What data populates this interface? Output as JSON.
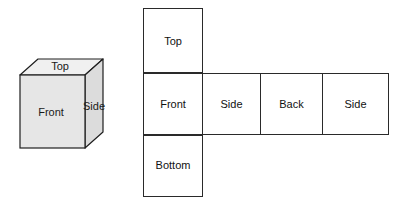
{
  "figure": {
    "title_visible": false,
    "background_color": "#ffffff"
  },
  "cube": {
    "name": "three-dimensional-cube",
    "projection": "oblique",
    "faces": [
      {
        "id": "front",
        "label": "Front",
        "fill": "#e6e6e6"
      },
      {
        "id": "top",
        "label": "Top",
        "fill": "#f0f0f0"
      },
      {
        "id": "side",
        "label": "Side",
        "fill": "#dcdcdc"
      }
    ],
    "outline_color": "#1f1f1f"
  },
  "net": {
    "name": "cube-net",
    "cell_fill": "#ffffff",
    "cell_border_color": "#2a2a2a",
    "column": [
      {
        "id": "top",
        "label": "Top"
      },
      {
        "id": "front",
        "label": "Front"
      },
      {
        "id": "bottom",
        "label": "Bottom"
      }
    ],
    "row": [
      {
        "id": "front",
        "label": "Front"
      },
      {
        "id": "side1",
        "label": "Side"
      },
      {
        "id": "back",
        "label": "Back"
      },
      {
        "id": "side2",
        "label": "Side"
      }
    ]
  }
}
